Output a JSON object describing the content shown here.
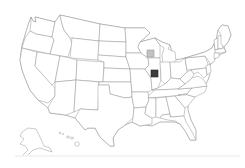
{
  "map": {
    "type": "choropleth-marker",
    "region": "United States",
    "background_color": "#ffffff",
    "state_fill": "#ffffff",
    "state_stroke": "#8a8a8a",
    "insets": [
      "Alaska",
      "Hawaii"
    ],
    "markers": [
      {
        "state": "Wisconsin",
        "shade": "light",
        "fill": "#c2c2c2",
        "stroke": "#9a9a9a",
        "x": 147,
        "y": 50,
        "size": 7
      },
      {
        "state": "Illinois",
        "shade": "dark",
        "fill": "#3c3c3c",
        "stroke": "#222222",
        "x": 151,
        "y": 70,
        "size": 7
      }
    ]
  }
}
